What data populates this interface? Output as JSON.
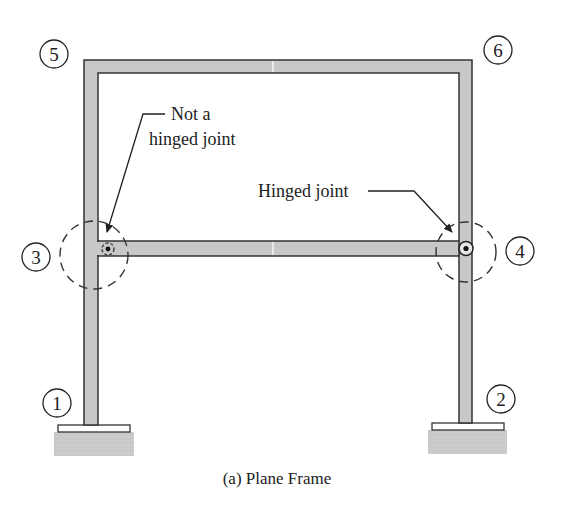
{
  "diagram": {
    "caption": "(a) Plane Frame",
    "nodes": [
      {
        "id": "1",
        "label": "1",
        "desc": "left fixed support"
      },
      {
        "id": "2",
        "label": "2",
        "desc": "right fixed support"
      },
      {
        "id": "3",
        "label": "3",
        "desc": "rigid joint (left column / beam)"
      },
      {
        "id": "4",
        "label": "4",
        "desc": "hinged joint (right column / beam)"
      },
      {
        "id": "5",
        "label": "5",
        "desc": "top-left corner"
      },
      {
        "id": "6",
        "label": "6",
        "desc": "top-right corner"
      }
    ],
    "annotations": {
      "not_hinged_line1": "Not a",
      "not_hinged_line2": "hinged joint",
      "hinged": "Hinged joint"
    },
    "colors": {
      "member_fill": "#c8c8c8",
      "member_stroke": "#333333",
      "ground_fill": "#c4c4c4",
      "text": "#222222"
    }
  }
}
